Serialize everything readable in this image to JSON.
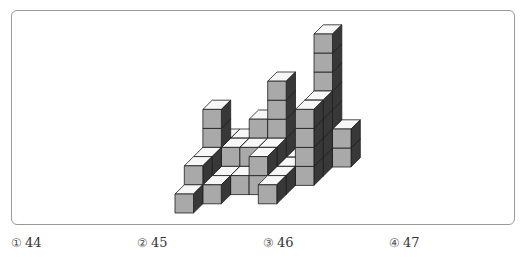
{
  "figure": {
    "colors": {
      "front": "#a9a9a9",
      "top": "#f7f7f7",
      "side": "#383838",
      "stroke": "#1e1e1e",
      "box_border": "#9a9a9a"
    },
    "geometry": {
      "origin_x": 175,
      "origin_y": 213,
      "cube_w": 18.5,
      "cube_h": 19,
      "depth_dx": 9.3,
      "depth_dy": 9.2
    },
    "columns": [
      {
        "c": 0,
        "d": 0,
        "h": 1
      },
      {
        "c": 0,
        "d": 1,
        "h": 2
      },
      {
        "c": 1,
        "d": 1,
        "h": 1
      },
      {
        "c": 1,
        "d": 2,
        "h": 1
      },
      {
        "c": 0,
        "d": 2,
        "h": 2
      },
      {
        "c": 2,
        "d": 2,
        "h": 1
      },
      {
        "c": 3,
        "d": 2,
        "h": 2
      },
      {
        "c": 0,
        "d": 3,
        "h": 4
      },
      {
        "c": 1,
        "d": 3,
        "h": 2
      },
      {
        "c": 2,
        "d": 3,
        "h": 2
      },
      {
        "c": 3,
        "d": 3,
        "h": 2
      },
      {
        "c": 0,
        "d": 4,
        "h": 2
      },
      {
        "c": 1,
        "d": 4,
        "h": 2
      },
      {
        "c": 2,
        "d": 4,
        "h": 3
      },
      {
        "c": 3,
        "d": 4,
        "h": 5
      },
      {
        "c": 4,
        "d": 1,
        "h": 1
      },
      {
        "c": 4,
        "d": 2,
        "h": 1
      },
      {
        "c": 4,
        "d": 3,
        "h": 1
      },
      {
        "c": 4,
        "d": 4,
        "h": 1
      },
      {
        "c": 4,
        "d": 5,
        "h": 1
      },
      {
        "c": 5,
        "d": 3,
        "h": 4
      },
      {
        "c": 5,
        "d": 4,
        "h": 4
      },
      {
        "c": 5,
        "d": 5,
        "h": 7
      },
      {
        "c": 5,
        "d": 6,
        "h": 1
      },
      {
        "c": 6,
        "d": 5,
        "h": 2
      }
    ]
  },
  "choices": [
    {
      "num": "①",
      "value": "44"
    },
    {
      "num": "②",
      "value": "45"
    },
    {
      "num": "③",
      "value": "46"
    },
    {
      "num": "④",
      "value": "47"
    }
  ]
}
